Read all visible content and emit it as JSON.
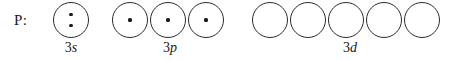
{
  "figure": {
    "element_label": "P:",
    "background_color": "#ffffff",
    "stroke_color": "#2b2b2b",
    "dot_color": "#1a1a1a"
  },
  "subshells": [
    {
      "name": "3s",
      "principal": "3",
      "orbital_letter": "s",
      "left": 53,
      "width": 36,
      "orbitals": [
        {
          "electrons": 2
        }
      ]
    },
    {
      "name": "3p",
      "principal": "3",
      "orbital_letter": "p",
      "left": 112,
      "width": 116,
      "orbitals": [
        {
          "electrons": 1
        },
        {
          "electrons": 1
        },
        {
          "electrons": 1
        }
      ]
    },
    {
      "name": "3d",
      "principal": "3",
      "orbital_letter": "d",
      "left": 252,
      "width": 196,
      "orbitals": [
        {
          "electrons": 0
        },
        {
          "electrons": 0
        },
        {
          "electrons": 0
        },
        {
          "electrons": 0
        },
        {
          "electrons": 0
        }
      ]
    }
  ]
}
